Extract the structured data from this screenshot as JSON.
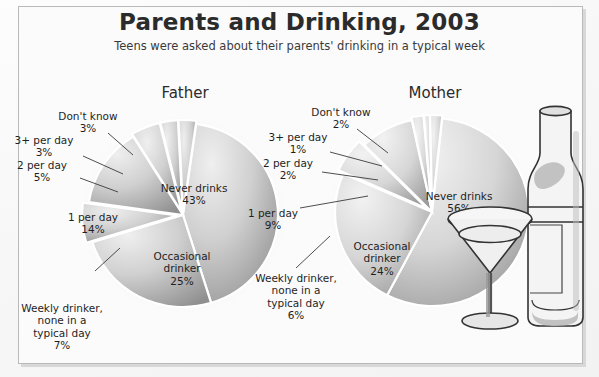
{
  "header": {
    "title": "Parents and Drinking, 2003",
    "subtitle": "Teens were asked about their parents' drinking in a typical week"
  },
  "art": {
    "bottle_label": "wine-bottle-illustration",
    "glass_label": "martini-glass-illustration"
  },
  "chart_data": [
    {
      "type": "pie",
      "title": "Father",
      "categories": [
        "Never drinks",
        "Occasional drinker",
        "Weekly drinker, none in a typical day",
        "1 per day",
        "2 per day",
        "3+ per day",
        "Don't know"
      ],
      "values": [
        43,
        25,
        7,
        14,
        5,
        3,
        3
      ],
      "labels": [
        "Never drinks\n43%",
        "Occasional\ndrinker\n25%",
        "Weekly drinker,\nnone in a\ntypical day\n7%",
        "1 per day\n14%",
        "2 per day\n5%",
        "3+ per day\n3%",
        "Don't know\n3%"
      ],
      "unit": "%",
      "legend": "none",
      "grid": false
    },
    {
      "type": "pie",
      "title": "Mother",
      "categories": [
        "Never drinks",
        "Occasional drinker",
        "Weekly drinker, none in a typical day",
        "1 per day",
        "2 per day",
        "3+ per day",
        "Don't know"
      ],
      "values": [
        56,
        24,
        6,
        9,
        2,
        1,
        2
      ],
      "labels": [
        "Never drinks\n56%",
        "Occasional\ndrinker\n24%",
        "Weekly drinker,\nnone in a\ntypical day\n6%",
        "1 per day\n9%",
        "2 per day\n2%",
        "3+ per day\n1%",
        "Don't know\n2%"
      ],
      "unit": "%",
      "legend": "none",
      "grid": false
    }
  ],
  "colors": {
    "slice_light": "#e3e3e3",
    "slice_mid": "#c9c9c9",
    "slice_dark": "#9a9a9a",
    "separator": "#ffffff",
    "text": "#1f1f1f",
    "frame": "#b9b9b9"
  }
}
